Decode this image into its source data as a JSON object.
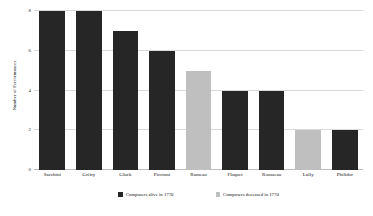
{
  "chart_data": {
    "type": "bar",
    "title": "",
    "xlabel": "",
    "ylabel": "Number of Performances",
    "ylim": [
      0,
      8
    ],
    "yticks": [
      0,
      2,
      4,
      6,
      8
    ],
    "ytick_labels": [
      "0",
      "2",
      "4",
      "6",
      "8"
    ],
    "gridlines": true,
    "grid_axis": "y",
    "legend_position": "bottom",
    "categories": [
      "Sacchini",
      "Grétry",
      "Gluck",
      "Piccinni",
      "Rameau",
      "Floquet",
      "Rousseau",
      "Lully",
      "Philidor"
    ],
    "values": [
      8,
      8,
      7,
      6,
      5,
      4,
      4,
      2,
      2
    ],
    "bar_status": [
      "alive",
      "alive",
      "alive",
      "alive",
      "deceased",
      "alive",
      "alive",
      "deceased",
      "alive"
    ],
    "legend": [
      {
        "label": "Composers alive in 1770",
        "color": "#262626",
        "key": "alive"
      },
      {
        "label": "Composers deceased in 1770",
        "color": "#bfbfbf",
        "key": "deceased"
      }
    ],
    "colors": {
      "alive": "#262626",
      "deceased": "#bfbfbf",
      "gridline": "#d9d9d9",
      "background": "#ffffff"
    }
  }
}
